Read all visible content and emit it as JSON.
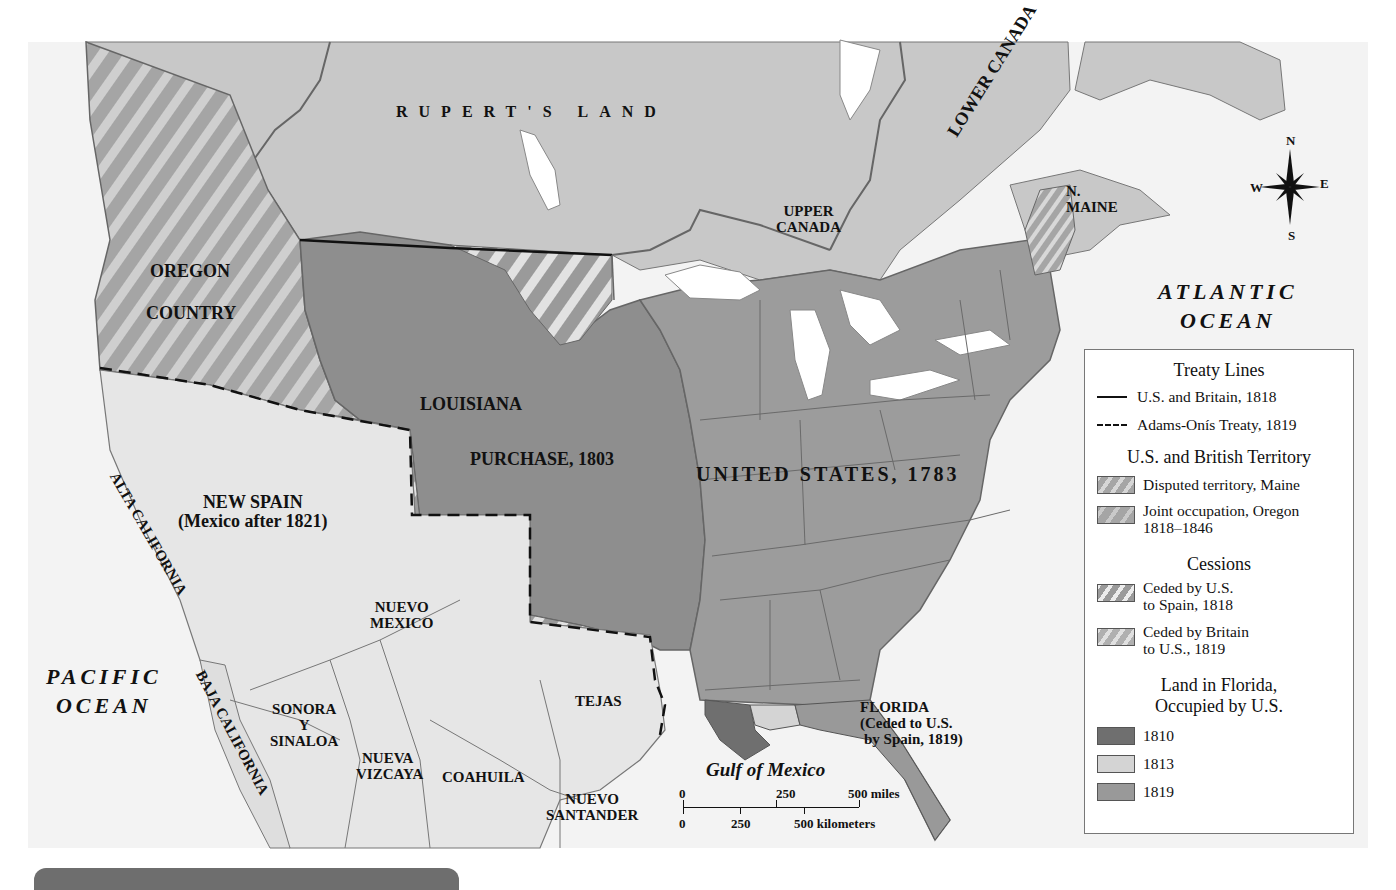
{
  "map": {
    "colors": {
      "ocean": "#ffffff",
      "british_territory": "#c9c9c9",
      "new_spain": "#e6e6e6",
      "united_states": "#9c9c9c",
      "louisiana": "#8e8e8e",
      "hatch_light": "#dadada",
      "florida_1810": "#6f6f6f",
      "florida_1813": "#d4d4d4",
      "florida_1819": "#999999",
      "treaty_line": "#111111",
      "region_border": "#5f5f5f",
      "lakes": "#ffffff"
    },
    "labels": {
      "ruperts_land": "RUPERT'S LAND",
      "lower_canada": "LOWER CANADA",
      "upper_canada_1": "UPPER",
      "upper_canada_2": "CANADA",
      "n_maine_1": "N.",
      "n_maine_2": "MAINE",
      "atlantic_1": "ATLANTIC",
      "atlantic_2": "OCEAN",
      "oregon_1": "OREGON",
      "oregon_2": "COUNTRY",
      "louisiana_1": "LOUISIANA",
      "louisiana_2": "PURCHASE, 1803",
      "united_states": "UNITED STATES, 1783",
      "new_spain_1": "NEW SPAIN",
      "new_spain_2": "(Mexico after 1821)",
      "alta_california": "ALTA CALIFORNIA",
      "baja_california": "BAJA CALIFORNIA",
      "nuevo_mexico_1": "NUEVO",
      "nuevo_mexico_2": "MEXICO",
      "pacific_1": "PACIFIC",
      "pacific_2": "OCEAN",
      "sonora_1": "SONORA",
      "sonora_2": "Y",
      "sonora_3": "SINALOA",
      "nueva_vizcaya_1": "NUEVA",
      "nueva_vizcaya_2": "VIZCAYA",
      "coahuila": "COAHUILA",
      "tejas": "TEJAS",
      "nuevo_santander_1": "NUEVO",
      "nuevo_santander_2": "SANTANDER",
      "gulf": "Gulf of Mexico",
      "florida_1": "FLORIDA",
      "florida_2": "(Ceded to U.S.",
      "florida_3": "by Spain, 1819)"
    },
    "compass": {
      "n": "N",
      "s": "S",
      "e": "E",
      "w": "W"
    },
    "scale": {
      "miles": [
        "0",
        "250",
        "500 miles"
      ],
      "kilometers": [
        "0",
        "250",
        "500 kilometers"
      ]
    }
  },
  "legend": {
    "treaty_lines": {
      "title": "Treaty Lines",
      "items": [
        {
          "label": "U.S. and Britain, 1818",
          "style": "solid"
        },
        {
          "label": "Adams-Onís Treaty, 1819",
          "style": "dashed"
        }
      ]
    },
    "territory": {
      "title": "U.S. and British Territory",
      "items": [
        {
          "label": "Disputed territory, Maine",
          "label2": ""
        },
        {
          "label": "Joint occupation, Oregon",
          "label2": "1818–1846"
        }
      ]
    },
    "cessions": {
      "title": "Cessions",
      "items": [
        {
          "label": "Ceded by U.S.",
          "label2": "to Spain, 1818"
        },
        {
          "label": "Ceded by Britain",
          "label2": "to U.S., 1819"
        }
      ]
    },
    "florida": {
      "title_1": "Land in Florida,",
      "title_2": "Occupied by U.S.",
      "items": [
        {
          "label": "1810"
        },
        {
          "label": "1813"
        },
        {
          "label": "1819"
        }
      ]
    }
  }
}
